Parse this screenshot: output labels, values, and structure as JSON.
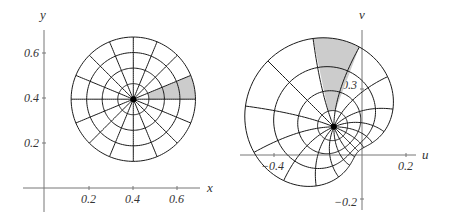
{
  "chart_data": [
    {
      "type": "diagram",
      "title": "",
      "description": "Polar grid on disk in z-plane",
      "xlabel": "x",
      "ylabel": "y",
      "xticks": [
        {
          "value": 0.2,
          "label": "0.2"
        },
        {
          "value": 0.4,
          "label": "0.4"
        },
        {
          "value": 0.6,
          "label": "0.6"
        }
      ],
      "yticks": [
        {
          "value": 0.2,
          "label": "0.2"
        },
        {
          "value": 0.4,
          "label": "0.4"
        },
        {
          "value": 0.6,
          "label": "0.6"
        }
      ],
      "disk": {
        "center": [
          0.4,
          0.4
        ],
        "radius": 0.28,
        "rings": 4,
        "rays": 16
      },
      "shaded_sector": {
        "r_from": 0.07,
        "r_to": 0.28,
        "angle_from_deg": 0,
        "angle_to_deg": 22.5
      },
      "mapping": "identity"
    },
    {
      "type": "diagram",
      "title": "",
      "description": "Image of the disk grid under w = z^3",
      "xlabel": "u",
      "ylabel": "v",
      "xticks": [
        {
          "value": -0.4,
          "label": "−0.4"
        },
        {
          "value": 0.2,
          "label": "0.2"
        }
      ],
      "yticks": [
        {
          "value": 0.3,
          "label": "0.3"
        },
        {
          "value": -0.2,
          "label": "−0.2"
        }
      ],
      "disk": {
        "center": [
          0.4,
          0.4
        ],
        "radius": 0.28,
        "rings": 4,
        "rays": 16
      },
      "shaded_sector": {
        "r_from": 0.07,
        "r_to": 0.28,
        "angle_from_deg": 0,
        "angle_to_deg": 22.5
      },
      "mapping": "z^3",
      "image_center": [
        -0.128,
        0.128
      ]
    }
  ],
  "colors": {
    "grid": "#1a1a1a",
    "axis": "#777777",
    "shade": "#cccccc",
    "dot": "#000000"
  },
  "plots": [
    {
      "xlabel": "x",
      "ylabel": "y",
      "xticks": [
        "0.2",
        "0.4",
        "0.6"
      ],
      "yticks": [
        "0.6",
        "0.4",
        "0.2"
      ]
    },
    {
      "xlabel": "u",
      "ylabel": "v",
      "xticks": [
        "−0.4",
        "0.2"
      ],
      "yticks": [
        "0.3",
        "−0.2"
      ]
    }
  ]
}
